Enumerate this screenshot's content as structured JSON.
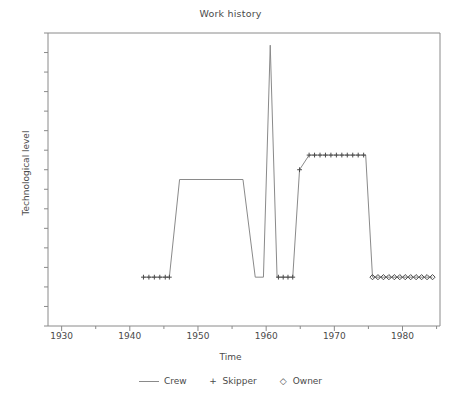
{
  "chart_data": {
    "type": "line",
    "title": "Work history",
    "xlabel": "Time",
    "ylabel": "Technological level",
    "xlim": [
      1928,
      1985.5
    ],
    "ylim": [
      0,
      12
    ],
    "grid": false,
    "legend_position": "bottom-center",
    "xticks_major": [
      1930,
      1940,
      1950,
      1960,
      1970,
      1980
    ],
    "xtick_labels": [
      "1930",
      "1940",
      "1950",
      "1960",
      "1970",
      "1980"
    ],
    "xticks_minor": [
      1935,
      1945,
      1955,
      1965,
      1975,
      1985
    ],
    "yticks_count": 15,
    "ytick_labels": [],
    "series": [
      {
        "name": "Crew",
        "marker": "line",
        "color": "#8a8a8a",
        "points": [
          {
            "x": 1942.0,
            "y": 2
          },
          {
            "x": 1945.8,
            "y": 2
          },
          {
            "x": 1947.3,
            "y": 6
          },
          {
            "x": 1956.6,
            "y": 6
          },
          {
            "x": 1958.4,
            "y": 2
          },
          {
            "x": 1959.6,
            "y": 2
          },
          {
            "x": 1960.6,
            "y": 11.5
          },
          {
            "x": 1961.6,
            "y": 2
          },
          {
            "x": 1963.9,
            "y": 2
          },
          {
            "x": 1964.9,
            "y": 6.4
          },
          {
            "x": 1966.3,
            "y": 7
          },
          {
            "x": 1974.6,
            "y": 7
          },
          {
            "x": 1975.6,
            "y": 2
          },
          {
            "x": 1984.4,
            "y": 2
          }
        ]
      },
      {
        "name": "Skipper",
        "marker": "+",
        "color": "#4a4a4a",
        "points": [
          {
            "x": 1942.0,
            "y": 2
          },
          {
            "x": 1942.8,
            "y": 2
          },
          {
            "x": 1943.6,
            "y": 2
          },
          {
            "x": 1944.4,
            "y": 2
          },
          {
            "x": 1945.2,
            "y": 2
          },
          {
            "x": 1945.8,
            "y": 2
          },
          {
            "x": 1961.8,
            "y": 2
          },
          {
            "x": 1962.5,
            "y": 2
          },
          {
            "x": 1963.2,
            "y": 2
          },
          {
            "x": 1963.9,
            "y": 2
          },
          {
            "x": 1964.9,
            "y": 6.4
          },
          {
            "x": 1966.3,
            "y": 7
          },
          {
            "x": 1967.1,
            "y": 7
          },
          {
            "x": 1967.9,
            "y": 7
          },
          {
            "x": 1968.7,
            "y": 7
          },
          {
            "x": 1969.5,
            "y": 7
          },
          {
            "x": 1970.3,
            "y": 7
          },
          {
            "x": 1971.1,
            "y": 7
          },
          {
            "x": 1971.9,
            "y": 7
          },
          {
            "x": 1972.7,
            "y": 7
          },
          {
            "x": 1973.5,
            "y": 7
          },
          {
            "x": 1974.3,
            "y": 7
          }
        ]
      },
      {
        "name": "Owner",
        "marker": "diamond",
        "color": "#4a4a4a",
        "points": [
          {
            "x": 1975.6,
            "y": 2
          },
          {
            "x": 1976.4,
            "y": 2
          },
          {
            "x": 1977.2,
            "y": 2
          },
          {
            "x": 1978.0,
            "y": 2
          },
          {
            "x": 1978.8,
            "y": 2
          },
          {
            "x": 1979.6,
            "y": 2
          },
          {
            "x": 1980.4,
            "y": 2
          },
          {
            "x": 1981.2,
            "y": 2
          },
          {
            "x": 1982.0,
            "y": 2
          },
          {
            "x": 1982.8,
            "y": 2
          },
          {
            "x": 1983.6,
            "y": 2
          },
          {
            "x": 1984.4,
            "y": 2
          }
        ]
      }
    ]
  },
  "legend": {
    "entries": [
      {
        "label": "Crew",
        "glyph": "line"
      },
      {
        "label": "Skipper",
        "glyph": "+"
      },
      {
        "label": "Owner",
        "glyph": "◇"
      }
    ]
  },
  "colors": {
    "axis": "#8a8a8a",
    "line": "#8a8a8a",
    "marker": "#4a4a4a",
    "text": "#4a4a4a",
    "background": "#ffffff"
  }
}
